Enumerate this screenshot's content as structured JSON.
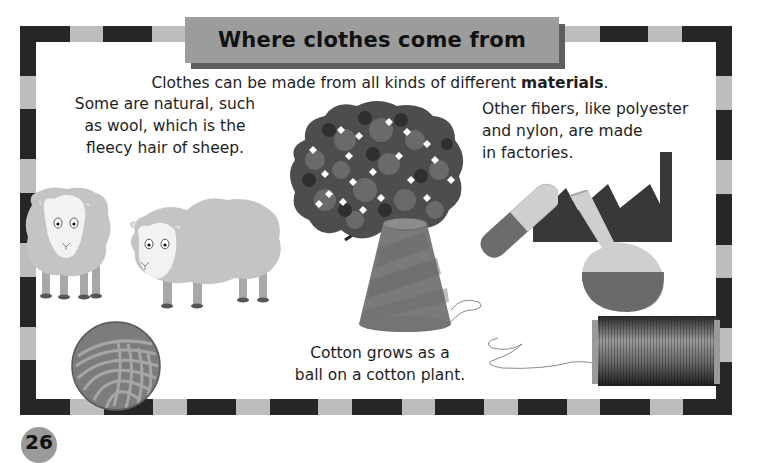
{
  "page": {
    "title": "Where clothes come from",
    "intro_prefix": "Clothes can be made from all kinds of different ",
    "intro_bold": "materials",
    "intro_suffix": ".",
    "natural_text": [
      "Some are natural, such",
      "as wool, which is the",
      "fleecy hair of sheep."
    ],
    "factory_text": [
      "Other fibers, like polyester",
      "and nylon, are made",
      "in factories."
    ],
    "cotton_text": [
      "Cotton grows as a",
      "ball on a cotton plant."
    ],
    "page_number": "26"
  },
  "illustrations": {
    "sheep_left": "sheep-icon",
    "sheep_right": "sheep-icon",
    "yarn_ball": "yarn-ball-icon",
    "cotton_plant": "cotton-plant-icon",
    "cotton_cone": "thread-cone-icon",
    "factory": "factory-icon",
    "test_tube": "test-tube-icon",
    "flask": "flask-icon",
    "spool": "thread-spool-icon"
  },
  "colors": {
    "border_dark": "#262626",
    "border_light": "#bdbdbd",
    "title_banner": "#9c9c9c",
    "title_shadow": "#5e5e5e"
  }
}
